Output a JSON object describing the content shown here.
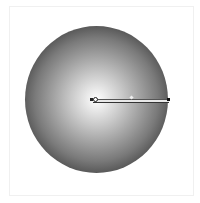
{
  "canvas": {
    "background": "#ffffff",
    "object": {
      "shape": "circle",
      "fill": "radial-gradient",
      "gradient_stops": [
        "#ffffff",
        "#000000"
      ]
    },
    "gradient_annotator": {
      "handles": [
        "origin",
        "midpoint",
        "end"
      ]
    }
  }
}
